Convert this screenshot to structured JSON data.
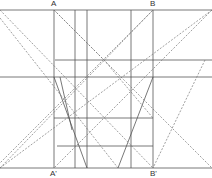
{
  "diagram": {
    "labels": {
      "A": "A",
      "B": "B",
      "A_prime": "A'",
      "B_prime": "B'"
    },
    "colors": {
      "solid": "#555555",
      "dashed": "#777777",
      "label": "#333333"
    }
  }
}
